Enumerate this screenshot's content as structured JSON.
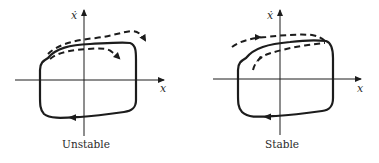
{
  "figure": {
    "panels": [
      {
        "id": "unstable",
        "caption": "Unstable",
        "x_axis_label": "x",
        "y_axis_label": "ẋ",
        "limit_cycle": "closed loop, clockwise (arrow on bottom edge pointing left)",
        "perturbed_trajectories": "dashed curves diverging away from the loop (outer one moves further out, inner one moves further in)"
      },
      {
        "id": "stable",
        "caption": "Stable",
        "x_axis_label": "x",
        "y_axis_label": "ẋ",
        "limit_cycle": "closed loop, clockwise (arrow on bottom edge pointing left)",
        "perturbed_trajectories": "dashed curves converging onto the loop from outside and inside"
      }
    ],
    "colors": {
      "ink": "#1c1c1c",
      "background": "#ffffff"
    }
  }
}
